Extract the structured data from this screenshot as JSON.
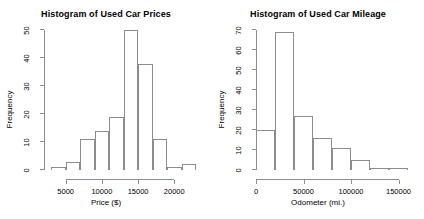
{
  "figure": {
    "background": "#ffffff",
    "axis_color": "#8c8c8c",
    "text_color": "#000000"
  },
  "chart_data": [
    {
      "type": "bar",
      "subtype": "histogram",
      "panel": "left",
      "title": "Histogram of Used Car Prices",
      "xlabel": "Price ($)",
      "ylabel": "Frequency",
      "grid": false,
      "legend": "none",
      "xlim": [
        2000,
        23000
      ],
      "ylim": [
        0,
        50
      ],
      "bin_width": 2000,
      "bin_edges": [
        3000,
        5000,
        7000,
        9000,
        11000,
        13000,
        15000,
        17000,
        19000,
        21000,
        23000
      ],
      "categories": [
        "3000-5000",
        "5000-7000",
        "7000-9000",
        "9000-11000",
        "11000-13000",
        "13000-15000",
        "15000-17000",
        "17000-19000",
        "19000-21000",
        "21000-23000"
      ],
      "values": [
        1,
        3,
        11,
        14,
        19,
        50,
        38,
        11,
        1,
        2
      ],
      "xticks": [
        5000,
        10000,
        15000,
        20000
      ],
      "xtick_labels": [
        "5000",
        "10000",
        "15000",
        "20000"
      ],
      "yticks": [
        0,
        10,
        20,
        30,
        40,
        50
      ],
      "ytick_labels": [
        "0",
        "10",
        "20",
        "30",
        "40",
        "50"
      ]
    },
    {
      "type": "bar",
      "subtype": "histogram",
      "panel": "right",
      "title": "Histogram of Used Car Mileage",
      "xlabel": "Odometer (mi.)",
      "ylabel": "Frequency",
      "grid": false,
      "legend": "none",
      "xlim": [
        0,
        160000
      ],
      "ylim": [
        0,
        70
      ],
      "bin_width": 20000,
      "bin_edges": [
        0,
        20000,
        40000,
        60000,
        80000,
        100000,
        120000,
        140000,
        160000
      ],
      "categories": [
        "0-20000",
        "20000-40000",
        "40000-60000",
        "60000-80000",
        "80000-100000",
        "100000-120000",
        "120000-140000",
        "140000-160000"
      ],
      "values": [
        20,
        69,
        27,
        16,
        11,
        5,
        1,
        1
      ],
      "xticks": [
        0,
        50000,
        100000,
        150000
      ],
      "xtick_labels": [
        "0",
        "50000",
        "100000",
        "150000"
      ],
      "yticks": [
        0,
        10,
        20,
        30,
        40,
        50,
        60,
        70
      ],
      "ytick_labels": [
        "0",
        "10",
        "20",
        "30",
        "40",
        "50",
        "60",
        "70"
      ]
    }
  ]
}
